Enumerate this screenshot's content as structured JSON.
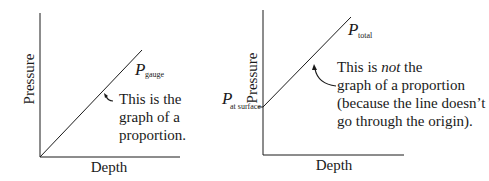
{
  "diagram": {
    "left_graph": {
      "y_axis_label": "Pressure",
      "x_axis_label": "Depth",
      "line_label_var": "P",
      "line_label_sub": "gauge",
      "note_lines": [
        "This is the",
        "graph of a",
        "proportion."
      ]
    },
    "right_graph": {
      "y_axis_label": "Pressure",
      "x_axis_label": "Depth",
      "line_label_var": "P",
      "line_label_sub": "total",
      "intercept_label_var": "P",
      "intercept_label_sub": "at surface",
      "note_line1_pre": "This is ",
      "note_line1_em": "not",
      "note_line1_post": " the",
      "note_lines_rest": [
        "graph of a proportion",
        "(because the line doesn’t",
        "go through the origin)."
      ]
    },
    "colors": {
      "ink": "#1a1a1a",
      "background": "#ffffff"
    }
  }
}
